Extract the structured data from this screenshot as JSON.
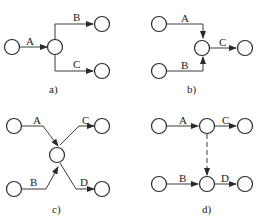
{
  "panels": {
    "a": {
      "caption": "a)",
      "edges": {
        "A": "A",
        "B": "B",
        "C": "C"
      }
    },
    "b": {
      "caption": "b)",
      "edges": {
        "A": "A",
        "B": "B",
        "C": "C"
      }
    },
    "c": {
      "caption": "c)",
      "edges": {
        "A": "A",
        "B": "B",
        "C": "C",
        "D": "D"
      }
    },
    "d": {
      "caption": "d)",
      "edges": {
        "A": "A",
        "B": "B",
        "C": "C",
        "D": "D"
      }
    }
  },
  "colors": {
    "stroke": "#2a2a2a",
    "background": "#ffffff"
  }
}
